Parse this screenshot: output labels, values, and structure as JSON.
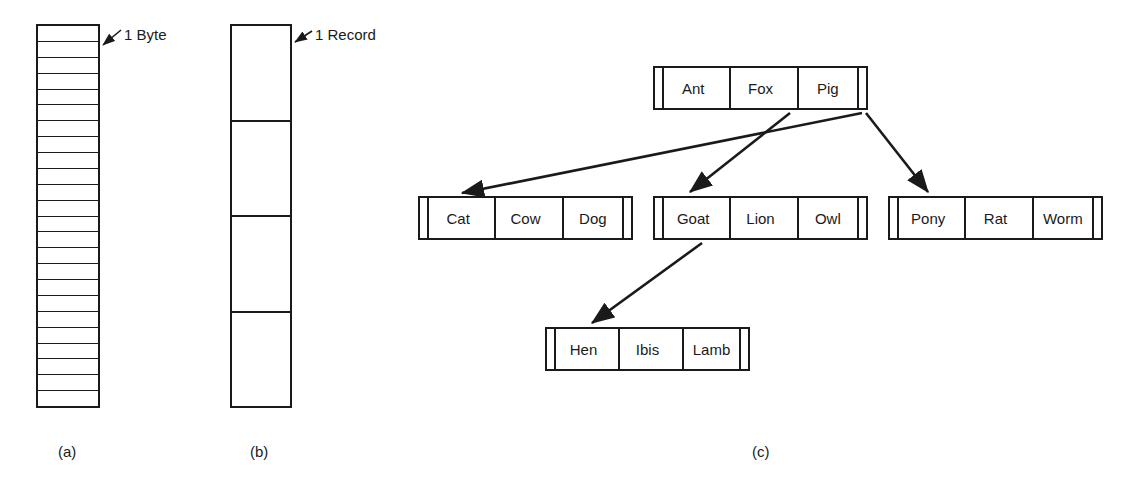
{
  "figure": {
    "panel_a": {
      "caption": "(a)",
      "callout": "1 Byte",
      "cell_count": 24,
      "description": "byte-addressable storage column"
    },
    "panel_b": {
      "caption": "(b)",
      "callout": "1 Record",
      "cell_count": 4,
      "description": "record-addressable storage column"
    },
    "panel_c": {
      "caption": "(c)",
      "description": "B-tree style index with key/pointer nodes",
      "nodes": [
        {
          "id": "root",
          "keys": [
            "Ant",
            "Fox",
            "Pig"
          ]
        },
        {
          "id": "cat",
          "keys": [
            "Cat",
            "Cow",
            "Dog"
          ]
        },
        {
          "id": "goat",
          "keys": [
            "Goat",
            "Lion",
            "Owl"
          ]
        },
        {
          "id": "pony",
          "keys": [
            "Pony",
            "Rat",
            "Worm"
          ]
        },
        {
          "id": "hen",
          "keys": [
            "Hen",
            "Ibis",
            "Lamb"
          ]
        }
      ],
      "edges": [
        {
          "from": "root",
          "to": "cat"
        },
        {
          "from": "root",
          "to": "goat"
        },
        {
          "from": "root",
          "to": "pony"
        },
        {
          "from": "goat",
          "to": "hen"
        }
      ]
    },
    "colors": {
      "ink": "#1a1a1a",
      "paper": "#ffffff"
    }
  }
}
